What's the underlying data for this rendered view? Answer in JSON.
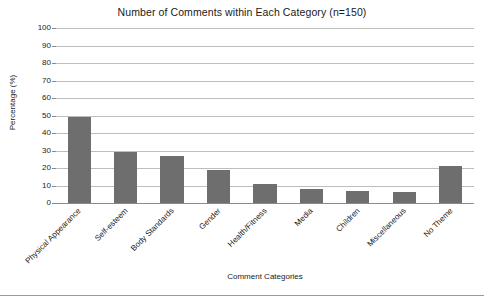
{
  "chart_data": {
    "type": "bar",
    "title": "Number of Comments within Each Category (n=150)",
    "xlabel": "Comment Categories",
    "ylabel": "Percentage (%)",
    "categories": [
      "Physical Appearance",
      "Self-esteem",
      "Body Standards",
      "Gender",
      "Health/Fitness",
      "Media",
      "Children",
      "Miscellaneous",
      "No Theme"
    ],
    "values": [
      49,
      29,
      27,
      19,
      11,
      8,
      7,
      6,
      21
    ],
    "ylim": [
      0,
      100
    ],
    "ytick_step": 10,
    "yticks": [
      "100",
      "90",
      "80",
      "70",
      "60",
      "50",
      "40",
      "30",
      "20",
      "10",
      "0"
    ],
    "grid": true,
    "legend": "none",
    "bar_color": "#6e6e6e",
    "gridline_color": "#bdbdbd",
    "axis_color": "#8a8a8a",
    "background_color": "#ffffff"
  }
}
